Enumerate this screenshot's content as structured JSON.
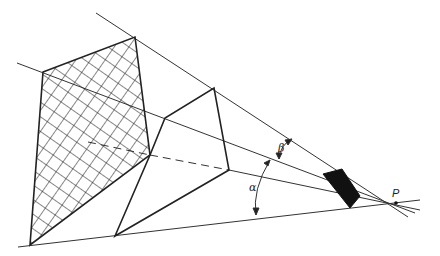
{
  "diagram": {
    "type": "perspective-projection",
    "labels": {
      "point": "P",
      "angle_alpha": "α",
      "angle_beta": "β"
    },
    "colors": {
      "stroke": "#222222",
      "fill_solid": "#111111",
      "background": "#ffffff"
    },
    "shapes": [
      {
        "name": "crosshatched-quadrilateral",
        "fill": "crosshatch"
      },
      {
        "name": "middle-quadrilateral",
        "fill": "none"
      },
      {
        "name": "small-solid-quadrilateral",
        "fill": "solid"
      }
    ]
  }
}
